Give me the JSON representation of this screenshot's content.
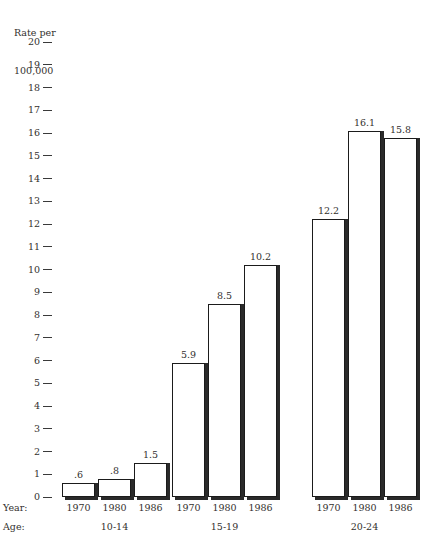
{
  "chart_data": {
    "type": "bar",
    "title": "",
    "ylabel": "Rate per\n100,000",
    "ylabel_lines": [
      "Rate per",
      "100,000"
    ],
    "xlabel": "",
    "ylim": [
      0,
      20
    ],
    "ytick_step": 1,
    "grid": false,
    "legend": "none",
    "ytick_labels": [
      "20",
      "19",
      "18",
      "17",
      "16",
      "15",
      "14",
      "13",
      "12",
      "11",
      "10",
      "9",
      "8",
      "7",
      "6",
      "5",
      "4",
      "3",
      "2",
      "1",
      "0"
    ],
    "categories": [
      "1970",
      "1980",
      "1986"
    ],
    "groups": [
      {
        "label": "10-14",
        "categories": [
          "1970",
          "1980",
          "1986"
        ],
        "values": [
          0.6,
          0.8,
          1.5
        ],
        "value_labels": [
          ".6",
          ".8",
          "1.5"
        ]
      },
      {
        "label": "15-19",
        "categories": [
          "1970",
          "1980",
          "1986"
        ],
        "values": [
          5.9,
          8.5,
          10.2
        ],
        "value_labels": [
          "5.9",
          "8.5",
          "10.2"
        ]
      },
      {
        "label": "20-24",
        "categories": [
          "1970",
          "1980",
          "1986"
        ],
        "values": [
          12.2,
          16.1,
          15.8
        ],
        "value_labels": [
          "12.2",
          "16.1",
          "15.8"
        ]
      }
    ],
    "series": [
      {
        "name": "1970",
        "values": [
          0.6,
          5.9,
          12.2
        ]
      },
      {
        "name": "1980",
        "values": [
          0.8,
          8.5,
          16.1
        ]
      },
      {
        "name": "1986",
        "values": [
          1.5,
          10.2,
          15.8
        ]
      }
    ],
    "row_labels": {
      "year": "Year:",
      "age": "Age:"
    },
    "colors": {
      "bar_fill": "#ffffff",
      "bar_edge": "#1b1b1b",
      "bar_shadow": "#2a2a2a",
      "text": "#33302e",
      "background": "#ffffff"
    }
  }
}
